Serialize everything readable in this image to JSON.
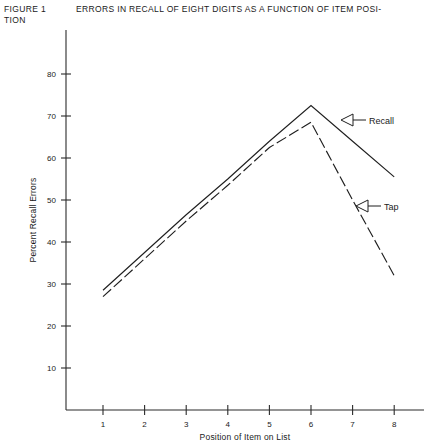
{
  "caption": {
    "figure_number": "FIGURE 1",
    "title": "ERRORS IN RECALL OF EIGHT DIGITS AS A FUNCTION OF ITEM POSI-",
    "title_line2": "TION"
  },
  "annotations": [
    {
      "name": "recall",
      "label": "Recall"
    },
    {
      "name": "tap",
      "label": "Tap"
    }
  ],
  "chart_data": {
    "type": "line",
    "xlabel": "Position of Item on List",
    "ylabel": "Percent Recall Errors",
    "x": [
      1,
      2,
      3,
      4,
      5,
      6,
      7,
      8
    ],
    "xlim": [
      0.6,
      8.6
    ],
    "ylim": [
      0,
      85
    ],
    "xticks": [
      "1",
      "2",
      "3",
      "4",
      "5",
      "6",
      "7",
      "8"
    ],
    "yticks": [
      "10",
      "20",
      "30",
      "40",
      "50",
      "60",
      "70",
      "80"
    ],
    "ytick_values": [
      10,
      20,
      30,
      40,
      50,
      60,
      70,
      80
    ],
    "grid": false,
    "legend": "inline-annotations",
    "series": [
      {
        "name": "Recall",
        "style": "solid",
        "color": "#1f1f1f",
        "values": [
          28.5,
          37.5,
          46.5,
          55,
          64,
          72.5,
          64,
          55.5
        ]
      },
      {
        "name": "Tap",
        "style": "dashed",
        "color": "#1f1f1f",
        "values": [
          27,
          36,
          45,
          53.5,
          62.5,
          68.5,
          50,
          32
        ]
      }
    ]
  }
}
